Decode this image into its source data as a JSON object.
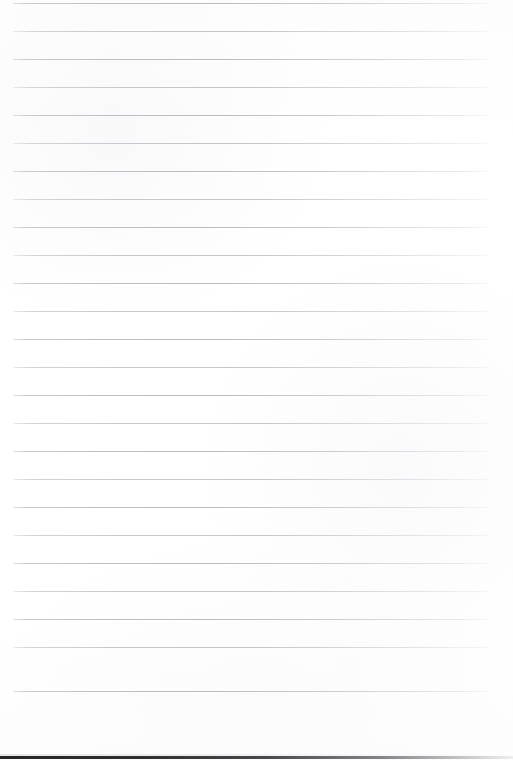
{
  "document": {
    "kind": "scanned-lined-paper",
    "title": "Blank Lined Paper",
    "has_text": false,
    "handwriting": "none",
    "orientation": "portrait"
  },
  "canvas": {
    "width": 513,
    "height": 760,
    "background_color": "#fefefe"
  },
  "ruling": {
    "line_count": 25,
    "first_line_y": 3,
    "line_spacing": 28,
    "last_line_y": 691,
    "line_left_x": 13,
    "line_right_x": 487,
    "line_length": 474,
    "line_thickness": 1,
    "line_color": "#c6c6cd",
    "has_vertical_margin_rule": false,
    "line_y_positions": [
      3,
      31,
      59,
      87,
      115,
      143,
      171,
      199,
      227,
      255,
      283,
      311,
      339,
      367,
      395,
      423,
      451,
      479,
      507,
      535,
      563,
      591,
      619,
      647,
      691
    ]
  },
  "bottom_edge": {
    "present": true,
    "y": 756,
    "height": 3,
    "color": "#1a1a1c",
    "description": "dark scan edge fading to the right"
  }
}
